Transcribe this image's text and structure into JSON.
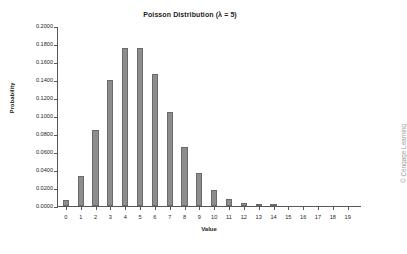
{
  "chart_data": {
    "type": "bar",
    "title": "Poisson Distribution (λ = 5)",
    "xlabel": "Value",
    "ylabel": "Probability",
    "categories": [
      "0",
      "1",
      "2",
      "3",
      "4",
      "5",
      "6",
      "7",
      "8",
      "9",
      "10",
      "11",
      "12",
      "13",
      "14",
      "15",
      "16",
      "17",
      "18",
      "19"
    ],
    "values": [
      0.0067,
      0.0337,
      0.0842,
      0.1404,
      0.1755,
      0.1755,
      0.1462,
      0.1044,
      0.0653,
      0.0363,
      0.0181,
      0.0082,
      0.0034,
      0.0013,
      0.0005,
      0.0002,
      0.0,
      0.0,
      0.0,
      0.0
    ],
    "ylim": [
      0.0,
      0.2
    ],
    "ytick_values": [
      0.0,
      0.02,
      0.04,
      0.06,
      0.08,
      0.1,
      0.12,
      0.14,
      0.16,
      0.18,
      0.2
    ],
    "ytick_labels": [
      "0.0000",
      "0.0200",
      "0.0400",
      "0.0600",
      "0.0800",
      "0.1000",
      "0.1200",
      "0.1400",
      "0.1600",
      "0.1800",
      "0.2000"
    ],
    "grid": false,
    "legend": null,
    "bar_color": "#8d8d8d",
    "bar_border_color": "#6a6a6a",
    "axis_color": "#58585a"
  },
  "credit": {
    "text": "© Cengage Learning"
  }
}
